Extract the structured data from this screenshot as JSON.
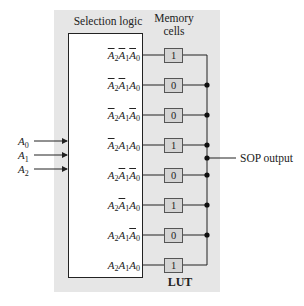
{
  "diagram": {
    "selection_logic_label": "Selection logic",
    "memory_cells_label_line1": "Memory",
    "memory_cells_label_line2": "cells",
    "lut_label": "LUT",
    "output_label": "SOP output",
    "inputs": [
      {
        "name": "A",
        "sub": "0"
      },
      {
        "name": "A",
        "sub": "1"
      },
      {
        "name": "A",
        "sub": "2"
      }
    ],
    "rows": [
      {
        "term": "A2'A1'A0'",
        "a2_bar": true,
        "a1_bar": true,
        "a0_bar": true,
        "cell": "1"
      },
      {
        "term": "A2'A1'A0",
        "a2_bar": true,
        "a1_bar": true,
        "a0_bar": false,
        "cell": "0"
      },
      {
        "term": "A2'A1A0'",
        "a2_bar": true,
        "a1_bar": false,
        "a0_bar": true,
        "cell": "0"
      },
      {
        "term": "A2'A1A0",
        "a2_bar": true,
        "a1_bar": false,
        "a0_bar": false,
        "cell": "1"
      },
      {
        "term": "A2A1'A0'",
        "a2_bar": false,
        "a1_bar": true,
        "a0_bar": true,
        "cell": "0"
      },
      {
        "term": "A2A1'A0",
        "a2_bar": false,
        "a1_bar": true,
        "a0_bar": false,
        "cell": "1"
      },
      {
        "term": "A2A1A0'",
        "a2_bar": false,
        "a1_bar": false,
        "a0_bar": true,
        "cell": "0"
      },
      {
        "term": "A2A1A0",
        "a2_bar": false,
        "a1_bar": false,
        "a0_bar": false,
        "cell": "1"
      }
    ],
    "colors": {
      "panel": "#e6e6e6",
      "cell_fill": "#d4d4d4",
      "line": "#222222"
    }
  }
}
